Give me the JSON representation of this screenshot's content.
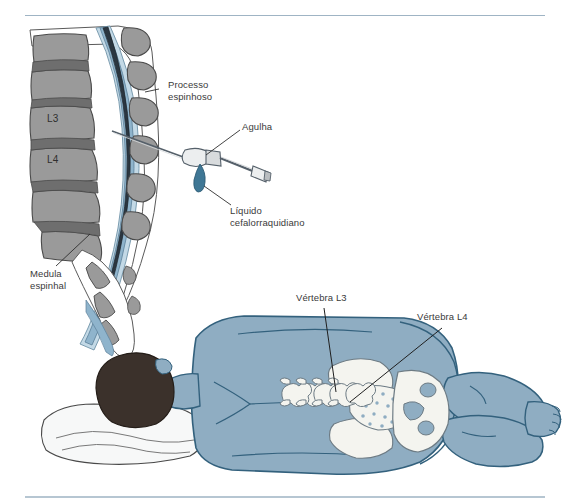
{
  "figure": {
    "name": "lumbar-puncture-illustration",
    "language": "pt-BR",
    "background_color": "#ffffff",
    "rule_color": "#9fb4c4"
  },
  "palette": {
    "bone_gray": "#9a9a9a",
    "bone_gray_dark": "#6e6e6e",
    "bone_outline": "#4a4a4a",
    "csf_blue": "#8fb4cc",
    "csf_blue_light": "#c3d9e6",
    "cord_dark": "#2b3640",
    "body_blue": "#8fadc2",
    "body_outline": "#33617d",
    "bone_white": "#f4f4ef",
    "head_dark": "#3b312b",
    "pillow_white": "#f7f8f8",
    "needle_gray": "#bfc3c6",
    "fluid_blue": "#3f7795",
    "leader_line": "#2f2f2f",
    "text_gray": "#3a3a3a"
  },
  "labels": {
    "spinous_process": {
      "text": "Processo\nespinhoso",
      "x": 168,
      "y": 84
    },
    "needle": {
      "text": "Agulha",
      "x": 242,
      "y": 125
    },
    "csf": {
      "text": "Líquido\ncefalorraquidiano",
      "x": 230,
      "y": 208
    },
    "spinal_cord": {
      "text": "Medula\nespinhal",
      "x": 30,
      "y": 272
    },
    "vertebra_l3": {
      "text": "Vértebra L3",
      "x": 296,
      "y": 296
    },
    "vertebra_l4": {
      "text": "Vértebra L4",
      "x": 417,
      "y": 315
    }
  },
  "vertebra_markers": {
    "l3": {
      "text": "L3",
      "x": 47,
      "y": 117
    },
    "l4": {
      "text": "L4",
      "x": 47,
      "y": 158
    }
  }
}
